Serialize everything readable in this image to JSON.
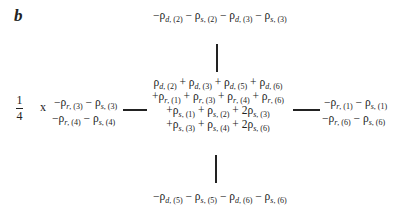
{
  "panel_label": "b",
  "prefactor": {
    "numerator": "1",
    "denominator": "4",
    "operator": "x"
  },
  "top_node": "−ρ_{d,(2)} − ρ_{s,(2)} − ρ_{d,(3)} − ρ_{s,(3)}",
  "bottom_node": "−ρ_{d,(5)} − ρ_{s,(5)} − ρ_{d,(6)} − ρ_{s,(6)}",
  "left_node": {
    "lines": [
      "−ρ_{r,(3)} − ρ_{s,(3)}",
      "−ρ_{r,(4)} − ρ_{s,(4)}"
    ]
  },
  "right_node": {
    "lines": [
      "−ρ_{r,(1)} − ρ_{s,(1)}",
      "−ρ_{r,(6)} − ρ_{s,(6)}"
    ]
  },
  "center_node": {
    "lines": [
      "ρ_{d,(2)} + ρ_{d,(3)} + ρ_{d,(5)} + ρ_{d,(6)}",
      "+ρ_{r,(1)} + ρ_{r,(3)} + ρ_{r,(4)} + ρ_{r,(6)}",
      "+ρ_{s,(1)} + ρ_{s,(2)} + 2ρ_{s,(3)}",
      "+ρ_{s,(3)} + ρ_{s,(4)} + 2ρ_{s,(6)}"
    ]
  },
  "connectors": [
    "center-top",
    "center-bottom",
    "center-left",
    "center-right"
  ],
  "colors": {
    "ink": "#222222",
    "background": "#ffffff"
  }
}
